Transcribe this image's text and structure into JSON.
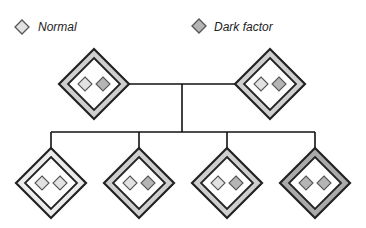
{
  "colors": {
    "normal_fill": "#e2e2e2",
    "dark_fill": "#b5b5b5",
    "band_light": "#ececec",
    "band_medium": "#cfcfcf",
    "band_dark": "#aaaaaa",
    "stroke": "#222222",
    "line": "#111111"
  },
  "legend": [
    {
      "id": "normal",
      "label": "Normal",
      "type": "normal"
    },
    {
      "id": "dark",
      "label": "Dark factor",
      "type": "dark"
    }
  ],
  "pedigree": {
    "parents": [
      {
        "id": "parent-left",
        "band": "medium",
        "alleles": [
          "normal",
          "dark"
        ]
      },
      {
        "id": "parent-right",
        "band": "medium",
        "alleles": [
          "normal",
          "dark"
        ]
      }
    ],
    "children": [
      {
        "id": "child-1",
        "band": "light",
        "alleles": [
          "normal",
          "normal"
        ]
      },
      {
        "id": "child-2",
        "band": "medium",
        "alleles": [
          "normal",
          "dark"
        ]
      },
      {
        "id": "child-3",
        "band": "medium",
        "alleles": [
          "normal",
          "dark"
        ]
      },
      {
        "id": "child-4",
        "band": "dark",
        "alleles": [
          "dark",
          "dark"
        ]
      }
    ]
  }
}
